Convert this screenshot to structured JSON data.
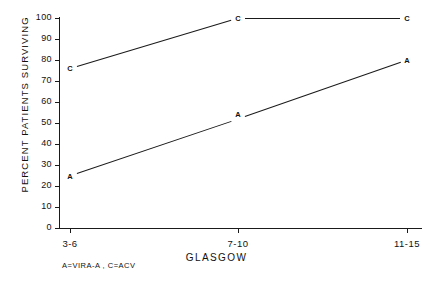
{
  "chart_data": {
    "type": "line",
    "title": "",
    "xlabel": "GLASGOW",
    "ylabel": "PERCENT PATIENTS SURVIVING",
    "categories": [
      "3-6",
      "7-10",
      "11-15"
    ],
    "ylim": [
      0,
      100
    ],
    "yticks": [
      0,
      10,
      20,
      30,
      40,
      50,
      60,
      70,
      80,
      90,
      100
    ],
    "grid": false,
    "legend_position": "below-axis-left",
    "legend_text": "A=VIRA-A , C=ACV",
    "point_marker_style": "letter",
    "series": [
      {
        "name": "C",
        "label": "ACV",
        "marker": "C",
        "values": [
          76,
          100,
          100
        ]
      },
      {
        "name": "A",
        "label": "VIRA-A",
        "marker": "A",
        "values": [
          25,
          52,
          80
        ]
      }
    ]
  }
}
